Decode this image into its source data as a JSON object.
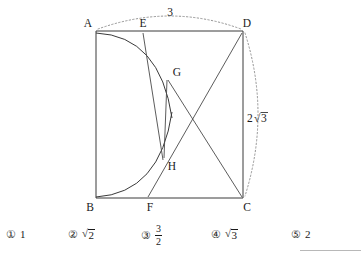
{
  "figure": {
    "type": "geometry-diagram",
    "shape": "rectangle",
    "vertices": [
      {
        "id": "A",
        "label": "A",
        "x": 96,
        "y": 31,
        "position": "top-left"
      },
      {
        "id": "B",
        "label": "B",
        "x": 96,
        "y": 198,
        "position": "bottom-left"
      },
      {
        "id": "C",
        "label": "C",
        "x": 243,
        "y": 198,
        "position": "bottom-right"
      },
      {
        "id": "D",
        "label": "D",
        "x": 243,
        "y": 31,
        "position": "top-right"
      },
      {
        "id": "E",
        "label": "E",
        "x": 143,
        "y": 31,
        "position": "on-top-edge"
      },
      {
        "id": "F",
        "label": "F",
        "x": 148,
        "y": 198,
        "position": "on-bottom-edge"
      },
      {
        "id": "G",
        "label": "G",
        "x": 169,
        "y": 78,
        "position": "interior-upper"
      },
      {
        "id": "H",
        "label": "H",
        "x": 163,
        "y": 158,
        "position": "interior-lower"
      }
    ],
    "measurements": [
      {
        "id": "top-arc",
        "label": "3",
        "x": 170,
        "y": 14,
        "side": "AD"
      },
      {
        "id": "right-arc",
        "label": "2√3",
        "x": 250,
        "y": 118,
        "side": "DC"
      }
    ],
    "labels": {
      "A": "A",
      "B": "B",
      "C": "C",
      "D": "D",
      "E": "E",
      "F": "F",
      "G": "G",
      "H": "H",
      "width": "3",
      "height_prefix": "2",
      "height_radicand": "3"
    }
  },
  "answers": {
    "options": [
      {
        "marker": "①",
        "value": "1",
        "kind": "plain",
        "x": 6
      },
      {
        "marker": "②",
        "value": "√2",
        "kind": "sqrt",
        "radicand": "2",
        "x": 68
      },
      {
        "marker": "③",
        "value": "3/2",
        "kind": "fraction",
        "numerator": "3",
        "denominator": "2",
        "x": 141
      },
      {
        "marker": "④",
        "value": "√3",
        "kind": "sqrt",
        "radicand": "3",
        "x": 211
      },
      {
        "marker": "⑤",
        "value": "2",
        "kind": "plain",
        "x": 291
      }
    ]
  },
  "colors": {
    "stroke": "#3a3a3a",
    "dotted": "#8a8a8a",
    "text": "#1a1a1a",
    "background": "#ffffff"
  }
}
